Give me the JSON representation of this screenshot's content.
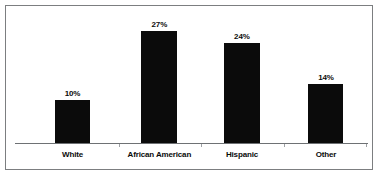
{
  "chart_data": {
    "type": "bar",
    "title": "",
    "subtitle": "",
    "xlabel": "",
    "ylabel": "",
    "grid": false,
    "legend": "none",
    "ylim": [
      0,
      30
    ],
    "categories": [
      "White",
      "African American",
      "Hispanic",
      "Other"
    ],
    "values": [
      10,
      27,
      24,
      14
    ],
    "value_labels": [
      "10%",
      "27%",
      "24%",
      "14%"
    ],
    "series": [
      {
        "name": "Percent",
        "values": [
          10,
          27,
          24,
          14
        ]
      }
    ],
    "bar_color": "#0b0b0b",
    "axis_color": "#6e7174",
    "frame_color": "#7c7e80",
    "background": "#ffffff"
  },
  "layout": {
    "bars": [
      {
        "center_pct": 16.3,
        "width_px": 35,
        "height_pct": 32.4
      },
      {
        "center_pct": 40.9,
        "width_px": 36,
        "height_pct": 84.2
      },
      {
        "center_pct": 64.3,
        "width_px": 36,
        "height_pct": 75.2
      },
      {
        "center_pct": 88.1,
        "width_px": 35,
        "height_pct": 44.3
      }
    ],
    "ticks_pct": [
      29.5,
      52.7,
      76.2,
      99.5
    ]
  }
}
